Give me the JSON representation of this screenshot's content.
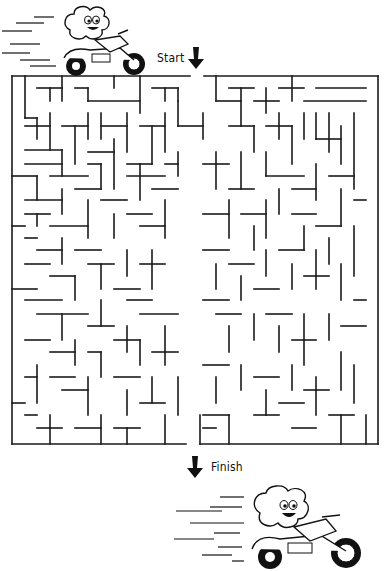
{
  "puzzle": {
    "type": "maze",
    "start_label": "Start",
    "finish_label": "Finish",
    "wall_color": "#1a1a1a",
    "background": "#ffffff",
    "border": {
      "x1": 12,
      "y1": 76,
      "x2": 378,
      "y2": 444
    },
    "entrance": {
      "x_from": 190,
      "x_to": 204,
      "side": "top"
    },
    "exit": {
      "x_from": 186,
      "x_to": 200,
      "side": "bottom"
    },
    "cell_size": 12.6,
    "cols": 29,
    "rows": 29,
    "walls": [
      [
        25,
        76,
        25,
        118
      ],
      [
        37,
        88,
        62,
        88
      ],
      [
        50,
        88,
        50,
        101
      ],
      [
        62,
        76,
        62,
        101
      ],
      [
        75,
        88,
        88,
        88
      ],
      [
        88,
        88,
        88,
        101
      ],
      [
        88,
        101,
        140,
        101
      ],
      [
        114,
        76,
        114,
        88
      ],
      [
        140,
        76,
        140,
        113
      ],
      [
        152,
        88,
        178,
        88
      ],
      [
        165,
        88,
        165,
        101
      ],
      [
        178,
        88,
        178,
        101
      ],
      [
        25,
        118,
        37,
        118
      ],
      [
        37,
        118,
        37,
        139
      ],
      [
        50,
        113,
        50,
        150
      ],
      [
        25,
        126,
        50,
        126
      ],
      [
        62,
        126,
        88,
        126
      ],
      [
        75,
        126,
        75,
        164
      ],
      [
        88,
        113,
        88,
        139
      ],
      [
        101,
        113,
        101,
        139
      ],
      [
        101,
        126,
        127,
        126
      ],
      [
        127,
        113,
        127,
        152
      ],
      [
        140,
        126,
        165,
        126
      ],
      [
        152,
        126,
        152,
        164
      ],
      [
        165,
        113,
        165,
        152
      ],
      [
        178,
        101,
        178,
        126
      ],
      [
        178,
        126,
        203,
        126
      ],
      [
        25,
        150,
        62,
        150
      ],
      [
        25,
        164,
        62,
        164
      ],
      [
        62,
        150,
        62,
        176
      ],
      [
        88,
        152,
        114,
        152
      ],
      [
        114,
        139,
        114,
        189
      ],
      [
        88,
        164,
        101,
        164
      ],
      [
        101,
        164,
        101,
        189
      ],
      [
        127,
        164,
        152,
        164
      ],
      [
        140,
        164,
        140,
        200
      ],
      [
        165,
        164,
        178,
        164
      ],
      [
        178,
        152,
        178,
        176
      ],
      [
        12,
        176,
        37,
        176
      ],
      [
        37,
        176,
        37,
        200
      ],
      [
        50,
        176,
        88,
        176
      ],
      [
        75,
        189,
        101,
        189
      ],
      [
        127,
        176,
        165,
        176
      ],
      [
        25,
        200,
        62,
        200
      ],
      [
        62,
        189,
        62,
        214
      ],
      [
        25,
        214,
        50,
        214
      ],
      [
        37,
        214,
        37,
        226
      ],
      [
        12,
        226,
        25,
        226
      ],
      [
        50,
        226,
        88,
        226
      ],
      [
        88,
        200,
        88,
        238
      ],
      [
        101,
        200,
        127,
        200
      ],
      [
        114,
        214,
        114,
        238
      ],
      [
        127,
        214,
        152,
        214
      ],
      [
        140,
        226,
        165,
        226
      ],
      [
        165,
        200,
        165,
        238
      ],
      [
        152,
        189,
        178,
        189
      ],
      [
        25,
        238,
        37,
        238
      ],
      [
        37,
        250,
        62,
        250
      ],
      [
        62,
        238,
        62,
        264
      ],
      [
        25,
        264,
        50,
        264
      ],
      [
        75,
        250,
        101,
        250
      ],
      [
        88,
        264,
        114,
        264
      ],
      [
        101,
        264,
        101,
        289
      ],
      [
        127,
        250,
        127,
        276
      ],
      [
        140,
        264,
        165,
        264
      ],
      [
        152,
        250,
        152,
        289
      ],
      [
        12,
        289,
        37,
        289
      ],
      [
        50,
        276,
        75,
        276
      ],
      [
        75,
        276,
        75,
        300
      ],
      [
        25,
        300,
        62,
        300
      ],
      [
        114,
        289,
        140,
        289
      ],
      [
        127,
        300,
        152,
        300
      ],
      [
        37,
        314,
        88,
        314
      ],
      [
        62,
        314,
        62,
        340
      ],
      [
        88,
        326,
        114,
        326
      ],
      [
        101,
        300,
        101,
        326
      ],
      [
        127,
        326,
        127,
        352
      ],
      [
        140,
        314,
        178,
        314
      ],
      [
        25,
        340,
        50,
        340
      ],
      [
        50,
        352,
        75,
        352
      ],
      [
        75,
        340,
        75,
        365
      ],
      [
        88,
        352,
        101,
        352
      ],
      [
        101,
        352,
        101,
        377
      ],
      [
        114,
        340,
        140,
        340
      ],
      [
        140,
        340,
        140,
        365
      ],
      [
        152,
        352,
        178,
        352
      ],
      [
        165,
        326,
        165,
        365
      ],
      [
        25,
        377,
        37,
        377
      ],
      [
        37,
        365,
        37,
        403
      ],
      [
        50,
        377,
        75,
        377
      ],
      [
        62,
        390,
        88,
        390
      ],
      [
        88,
        377,
        88,
        415
      ],
      [
        114,
        377,
        140,
        377
      ],
      [
        127,
        390,
        127,
        415
      ],
      [
        140,
        403,
        165,
        403
      ],
      [
        152,
        377,
        152,
        403
      ],
      [
        165,
        415,
        165,
        444
      ],
      [
        12,
        403,
        25,
        403
      ],
      [
        25,
        415,
        37,
        415
      ],
      [
        37,
        428,
        62,
        428
      ],
      [
        50,
        415,
        50,
        444
      ],
      [
        75,
        428,
        101,
        428
      ],
      [
        101,
        415,
        101,
        444
      ],
      [
        114,
        428,
        140,
        428
      ],
      [
        127,
        428,
        127,
        444
      ],
      [
        178,
        377,
        178,
        415
      ],
      [
        216,
        76,
        216,
        101
      ],
      [
        216,
        101,
        241,
        101
      ],
      [
        229,
        88,
        254,
        88
      ],
      [
        241,
        88,
        241,
        126
      ],
      [
        254,
        101,
        279,
        101
      ],
      [
        266,
        88,
        266,
        113
      ],
      [
        279,
        88,
        304,
        88
      ],
      [
        292,
        76,
        292,
        101
      ],
      [
        304,
        101,
        366,
        101
      ],
      [
        316,
        88,
        366,
        88
      ],
      [
        229,
        126,
        254,
        126
      ],
      [
        203,
        113,
        203,
        139
      ],
      [
        254,
        126,
        254,
        152
      ],
      [
        266,
        126,
        292,
        126
      ],
      [
        279,
        113,
        279,
        139
      ],
      [
        292,
        126,
        292,
        164
      ],
      [
        304,
        113,
        304,
        139
      ],
      [
        316,
        113,
        316,
        139
      ],
      [
        329,
        113,
        329,
        152
      ],
      [
        341,
        126,
        341,
        164
      ],
      [
        354,
        113,
        354,
        189
      ],
      [
        316,
        139,
        341,
        139
      ],
      [
        203,
        164,
        229,
        164
      ],
      [
        216,
        152,
        216,
        189
      ],
      [
        241,
        152,
        241,
        189
      ],
      [
        229,
        189,
        254,
        189
      ],
      [
        266,
        152,
        266,
        176
      ],
      [
        266,
        176,
        304,
        176
      ],
      [
        279,
        189,
        279,
        214
      ],
      [
        292,
        189,
        316,
        189
      ],
      [
        316,
        164,
        316,
        200
      ],
      [
        329,
        176,
        354,
        176
      ],
      [
        341,
        189,
        341,
        226
      ],
      [
        354,
        200,
        366,
        200
      ],
      [
        203,
        214,
        229,
        214
      ],
      [
        229,
        200,
        229,
        238
      ],
      [
        241,
        214,
        266,
        214
      ],
      [
        254,
        226,
        254,
        250
      ],
      [
        266,
        200,
        266,
        238
      ],
      [
        292,
        214,
        316,
        214
      ],
      [
        304,
        226,
        304,
        250
      ],
      [
        316,
        226,
        341,
        226
      ],
      [
        329,
        238,
        329,
        264
      ],
      [
        354,
        226,
        354,
        276
      ],
      [
        203,
        250,
        229,
        250
      ],
      [
        216,
        264,
        216,
        289
      ],
      [
        229,
        264,
        254,
        264
      ],
      [
        241,
        276,
        241,
        300
      ],
      [
        254,
        289,
        279,
        289
      ],
      [
        266,
        250,
        266,
        276
      ],
      [
        279,
        250,
        304,
        250
      ],
      [
        292,
        264,
        292,
        289
      ],
      [
        304,
        276,
        329,
        276
      ],
      [
        316,
        250,
        316,
        289
      ],
      [
        341,
        264,
        341,
        300
      ],
      [
        354,
        300,
        366,
        300
      ],
      [
        203,
        300,
        229,
        300
      ],
      [
        216,
        314,
        241,
        314
      ],
      [
        229,
        326,
        229,
        352
      ],
      [
        254,
        314,
        254,
        340
      ],
      [
        266,
        314,
        292,
        314
      ],
      [
        279,
        326,
        279,
        352
      ],
      [
        292,
        340,
        316,
        340
      ],
      [
        304,
        314,
        304,
        365
      ],
      [
        329,
        314,
        329,
        340
      ],
      [
        341,
        326,
        366,
        326
      ],
      [
        203,
        365,
        229,
        365
      ],
      [
        216,
        377,
        216,
        403
      ],
      [
        241,
        365,
        241,
        390
      ],
      [
        254,
        377,
        279,
        377
      ],
      [
        266,
        390,
        266,
        415
      ],
      [
        279,
        403,
        304,
        403
      ],
      [
        292,
        365,
        292,
        390
      ],
      [
        304,
        390,
        329,
        390
      ],
      [
        316,
        377,
        316,
        415
      ],
      [
        341,
        352,
        341,
        390
      ],
      [
        354,
        365,
        354,
        403
      ],
      [
        329,
        415,
        354,
        415
      ],
      [
        341,
        415,
        341,
        444
      ],
      [
        203,
        415,
        229,
        415
      ],
      [
        229,
        415,
        229,
        444
      ],
      [
        254,
        415,
        279,
        415
      ],
      [
        292,
        428,
        316,
        428
      ],
      [
        366,
        415,
        366,
        444
      ],
      [
        203,
        428,
        216,
        428
      ],
      [
        200,
        415,
        200,
        444
      ]
    ]
  },
  "decorations": {
    "top_mascot": "cartoon-character-on-motorcycle",
    "bottom_mascot": "cartoon-character-on-motorcycle"
  }
}
